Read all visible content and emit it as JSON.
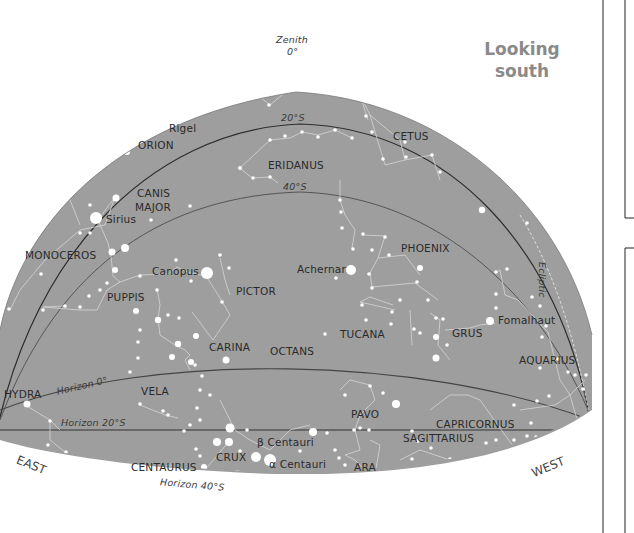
{
  "title": {
    "line1": "Looking",
    "line2": "south"
  },
  "zenith": {
    "label": "Zenith",
    "value": "0°"
  },
  "grid_labels": {
    "dec20": "20°S",
    "dec40": "40°S",
    "ecliptic": "Ecliptic",
    "horizon0": "Horizon 0°",
    "horizon20": "Horizon 20°S",
    "horizon40": "Horizon 40°S"
  },
  "directions": {
    "east": "EAST",
    "west": "WEST"
  },
  "constellations": {
    "orion": "ORION",
    "cetus": "CETUS",
    "eridanus": "ERIDANUS",
    "canis_major_1": "CANIS",
    "canis_major_2": "MAJOR",
    "monoceros": "MONOCEROS",
    "phoenix": "PHOENIX",
    "puppis": "PUPPIS",
    "pictor": "PICTOR",
    "carina": "CARINA",
    "octans": "OCTANS",
    "tucana": "TUCANA",
    "grus": "GRUS",
    "aquarius": "AQUARIUS",
    "hydra": "HYDRA",
    "vela": "VELA",
    "pavo": "PAVO",
    "capricornus": "CAPRICORNUS",
    "sagittarius": "SAGITTARIUS",
    "crux": "CRUX",
    "centaurus": "CENTAURUS",
    "ara": "ARA"
  },
  "stars": {
    "rigel": "Rigel",
    "sirius": "Sirius",
    "canopus": "Canopus",
    "achernar": "Achernar",
    "fomalhaut": "Fomalhaut",
    "beta_centauri": "β Centauri",
    "alpha_centauri": "α Centauri"
  },
  "colors": {
    "sky": "#9e9e9e",
    "star": "#ffffff",
    "line": "#d8d8d8",
    "grid": "#4a4a4a",
    "title": "#8a8a8a"
  }
}
